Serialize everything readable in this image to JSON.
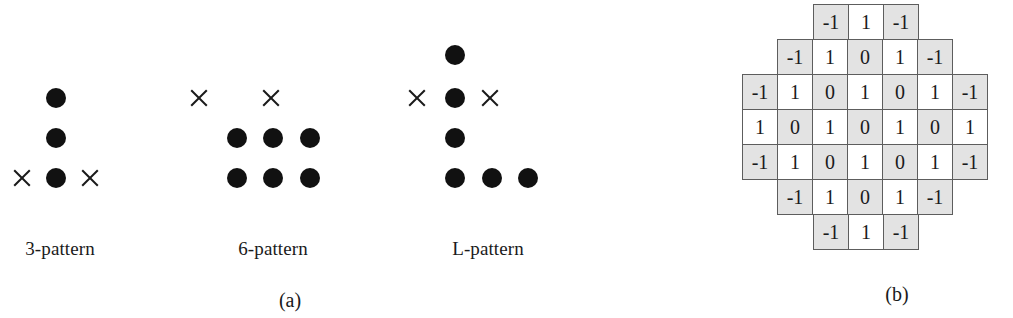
{
  "figure": {
    "panel_a": {
      "caption": "(a)",
      "caption_x": 290,
      "caption_y": 289,
      "patterns": [
        {
          "name": "3-pattern",
          "label": "3-pattern",
          "label_x": 60,
          "label_y": 238,
          "dots": [
            {
              "x": 56,
              "y": 98
            },
            {
              "x": 56,
              "y": 138
            },
            {
              "x": 56,
              "y": 178
            }
          ],
          "crosses": [
            {
              "x": 22,
              "y": 178
            },
            {
              "x": 90,
              "y": 178
            }
          ]
        },
        {
          "name": "6-pattern",
          "label": "6-pattern",
          "label_x": 273,
          "label_y": 238,
          "dots": [
            {
              "x": 237,
              "y": 138
            },
            {
              "x": 273,
              "y": 138
            },
            {
              "x": 310,
              "y": 138
            },
            {
              "x": 237,
              "y": 178
            },
            {
              "x": 273,
              "y": 178
            },
            {
              "x": 310,
              "y": 178
            }
          ],
          "crosses": [
            {
              "x": 199,
              "y": 98
            },
            {
              "x": 271,
              "y": 98
            }
          ]
        },
        {
          "name": "L-pattern",
          "label": "L-pattern",
          "label_x": 488,
          "label_y": 238,
          "dots": [
            {
              "x": 455,
              "y": 55
            },
            {
              "x": 455,
              "y": 98
            },
            {
              "x": 455,
              "y": 138
            },
            {
              "x": 455,
              "y": 178
            },
            {
              "x": 492,
              "y": 178
            },
            {
              "x": 528,
              "y": 178
            }
          ],
          "crosses": [
            {
              "x": 417,
              "y": 98
            },
            {
              "x": 490,
              "y": 98
            }
          ]
        }
      ]
    },
    "panel_b": {
      "caption": "(b)",
      "caption_x": 277,
      "caption_y": 283
    }
  },
  "chart_data": {
    "type": "table",
    "title": "",
    "grid_columns": 7,
    "grid_rows": 7,
    "rows": [
      {
        "offset": 2,
        "values": [
          "-1",
          "1",
          "-1"
        ]
      },
      {
        "offset": 1,
        "values": [
          "-1",
          "1",
          "0",
          "1",
          "-1"
        ]
      },
      {
        "offset": 0,
        "values": [
          "-1",
          "1",
          "0",
          "1",
          "0",
          "1",
          "-1"
        ]
      },
      {
        "offset": 0,
        "values": [
          "1",
          "0",
          "1",
          "0",
          "1",
          "0",
          "1"
        ]
      },
      {
        "offset": 0,
        "values": [
          "-1",
          "1",
          "0",
          "1",
          "0",
          "1",
          "-1"
        ]
      },
      {
        "offset": 1,
        "values": [
          "-1",
          "1",
          "0",
          "1",
          "-1"
        ]
      },
      {
        "offset": 2,
        "values": [
          "-1",
          "1",
          "-1"
        ]
      }
    ],
    "shaded_parity": 0,
    "colors": {
      "cell_shaded": "#e3e3e3",
      "cell_plain": "#ffffff",
      "cell_border": "#5d5d5d",
      "text": "#1a1a1a",
      "dot": "#111111"
    }
  }
}
